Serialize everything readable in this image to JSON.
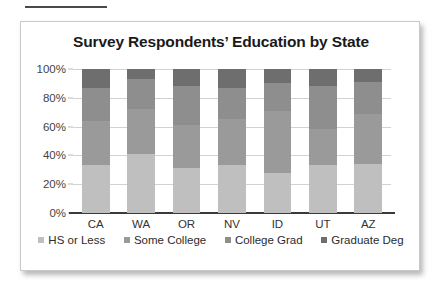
{
  "page": {
    "top_rule": "decorative-rule"
  },
  "chart_data": {
    "type": "bar",
    "subtype": "stacked-100-percent",
    "title": "Survey Respondents’ Education by State",
    "xlabel": "",
    "ylabel": "",
    "ylim": [
      0,
      100
    ],
    "grid": true,
    "legend_position": "bottom",
    "categories": [
      "CA",
      "WA",
      "OR",
      "NV",
      "ID",
      "UT",
      "AZ"
    ],
    "ytick_labels": [
      "0%",
      "20%",
      "40%",
      "60%",
      "80%",
      "100%"
    ],
    "ytick_values": [
      0,
      20,
      40,
      60,
      80,
      100
    ],
    "series": [
      {
        "name": "HS or Less",
        "color": "#bfbfbf",
        "values": [
          33,
          41,
          31,
          33,
          28,
          33,
          34
        ]
      },
      {
        "name": "Some College",
        "color": "#9a9a9a",
        "values": [
          31,
          31,
          30,
          32,
          43,
          25,
          35
        ]
      },
      {
        "name": "College Grad",
        "color": "#8e8e8e",
        "values": [
          23,
          21,
          27,
          22,
          19,
          30,
          22
        ]
      },
      {
        "name": "Graduate Deg",
        "color": "#6e6e6e",
        "values": [
          13,
          7,
          12,
          13,
          10,
          12,
          9
        ]
      }
    ]
  }
}
